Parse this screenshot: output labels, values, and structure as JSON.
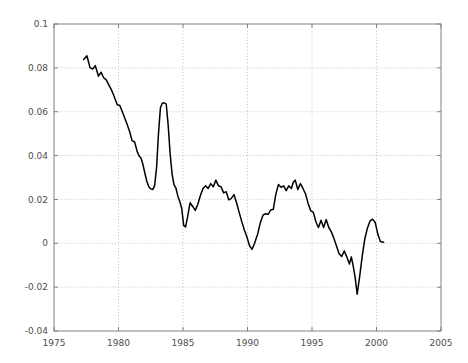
{
  "chart_data": {
    "type": "line",
    "title": "",
    "subtitle": "",
    "xlabel": "",
    "ylabel": "",
    "xlim": [
      1975,
      2005
    ],
    "ylim": [
      -0.04,
      0.1
    ],
    "grid": true,
    "legend": null,
    "xticks": [
      1975,
      1980,
      1985,
      1990,
      1995,
      2000,
      2005
    ],
    "xtick_labels": [
      "1975",
      "1980",
      "1985",
      "1990",
      "1995",
      "2000",
      "2005"
    ],
    "yticks": [
      -0.04,
      -0.02,
      0,
      0.02,
      0.04,
      0.06,
      0.08,
      0.1
    ],
    "ytick_labels": [
      "-0.04",
      "-0.02",
      "0",
      "0.02",
      "0.04",
      "0.06",
      "0.08",
      "0.1"
    ],
    "line_color": "#000000",
    "axis_color": "#808080",
    "grid_color": "#b3b3b3",
    "background_color": "#ffffff",
    "series": [
      {
        "name": "series-1",
        "x": [
          1977.3,
          1977.55,
          1977.8,
          1978.0,
          1978.2,
          1978.45,
          1978.65,
          1978.85,
          1979.05,
          1979.25,
          1979.45,
          1979.65,
          1979.9,
          1980.1,
          1980.35,
          1980.6,
          1980.85,
          1981.05,
          1981.25,
          1981.45,
          1981.6,
          1981.75,
          1981.9,
          1982.05,
          1982.2,
          1982.35,
          1982.5,
          1982.65,
          1982.8,
          1982.95,
          1983.1,
          1983.25,
          1983.4,
          1983.55,
          1983.7,
          1983.85,
          1984.0,
          1984.15,
          1984.3,
          1984.45,
          1984.6,
          1984.75,
          1984.9,
          1985.05,
          1985.2,
          1985.35,
          1985.55,
          1985.75,
          1985.95,
          1986.15,
          1986.35,
          1986.55,
          1986.75,
          1986.95,
          1987.15,
          1987.35,
          1987.55,
          1987.75,
          1987.95,
          1988.15,
          1988.35,
          1988.55,
          1988.75,
          1988.95,
          1989.15,
          1989.35,
          1989.55,
          1989.75,
          1989.95,
          1990.15,
          1990.35,
          1990.55,
          1990.8,
          1991.0,
          1991.2,
          1991.4,
          1991.6,
          1991.8,
          1992.0,
          1992.2,
          1992.4,
          1992.6,
          1992.8,
          1993.0,
          1993.2,
          1993.4,
          1993.55,
          1993.7,
          1993.9,
          1994.1,
          1994.3,
          1994.5,
          1994.7,
          1994.9,
          1995.1,
          1995.3,
          1995.5,
          1995.7,
          1995.9,
          1996.1,
          1996.3,
          1996.5,
          1996.7,
          1996.9,
          1997.1,
          1997.3,
          1997.5,
          1997.7,
          1997.9,
          1998.05,
          1998.2,
          1998.35,
          1998.5,
          1998.7,
          1998.9,
          1999.1,
          1999.3,
          1999.5,
          1999.7,
          1999.9,
          2000.1,
          2000.3,
          2000.55
        ],
        "y": [
          0.0838,
          0.0855,
          0.08,
          0.0795,
          0.081,
          0.0762,
          0.078,
          0.0755,
          0.0745,
          0.0722,
          0.07,
          0.0672,
          0.0632,
          0.0628,
          0.0592,
          0.0553,
          0.0512,
          0.0468,
          0.0462,
          0.0418,
          0.0398,
          0.0388,
          0.0358,
          0.0318,
          0.0282,
          0.0258,
          0.0248,
          0.0245,
          0.0262,
          0.0345,
          0.05,
          0.0618,
          0.064,
          0.064,
          0.0635,
          0.054,
          0.041,
          0.0318,
          0.0268,
          0.0252,
          0.0215,
          0.019,
          0.016,
          0.0082,
          0.0075,
          0.0118,
          0.0185,
          0.0168,
          0.015,
          0.0178,
          0.0218,
          0.025,
          0.0262,
          0.025,
          0.0272,
          0.0258,
          0.0288,
          0.0262,
          0.0258,
          0.023,
          0.0235,
          0.0198,
          0.0205,
          0.0222,
          0.0185,
          0.0142,
          0.01,
          0.0062,
          0.003,
          -0.001,
          -0.0028,
          0.0,
          0.0045,
          0.0095,
          0.0128,
          0.0135,
          0.0132,
          0.0152,
          0.0155,
          0.0225,
          0.0268,
          0.0255,
          0.0262,
          0.024,
          0.0262,
          0.025,
          0.0278,
          0.0288,
          0.0245,
          0.0272,
          0.025,
          0.0225,
          0.0182,
          0.0148,
          0.0142,
          0.0098,
          0.0072,
          0.0105,
          0.0072,
          0.0108,
          0.0072,
          0.0052,
          0.0022,
          -0.0012,
          -0.0048,
          -0.006,
          -0.0035,
          -0.0062,
          -0.0095,
          -0.0062,
          -0.0105,
          -0.0158,
          -0.0232,
          -0.015,
          -0.0055,
          0.0022,
          0.007,
          0.0102,
          0.011,
          0.0095,
          0.0042,
          0.0008,
          0.0005
        ]
      }
    ]
  }
}
